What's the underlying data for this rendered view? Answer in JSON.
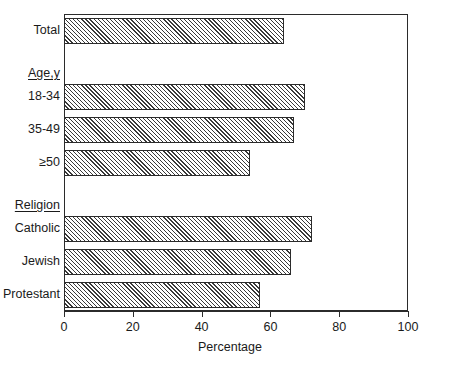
{
  "chart_data": {
    "type": "bar",
    "orientation": "horizontal",
    "title": "",
    "xlabel": "Percentage",
    "ylabel": "",
    "xlim": [
      0,
      100
    ],
    "xticks": [
      0,
      20,
      40,
      60,
      80,
      100
    ],
    "xticklabels": [
      "0",
      "20",
      "40",
      "60",
      "80",
      "100"
    ],
    "grid": false,
    "legend": null,
    "categories": [
      "Total",
      "18-34",
      "35-49",
      "≥50",
      "Catholic",
      "Jewish",
      "Protestant"
    ],
    "values": [
      64,
      70,
      67,
      54,
      72,
      66,
      57
    ],
    "group_headers": [
      "Age,y",
      "Religion"
    ],
    "rows": [
      {
        "kind": "bar",
        "label": "Total",
        "value": 64
      },
      {
        "kind": "header",
        "label": "Age,y",
        "value": null
      },
      {
        "kind": "bar",
        "label": "18-34",
        "value": 70
      },
      {
        "kind": "bar",
        "label": "35-49",
        "value": 67
      },
      {
        "kind": "bar",
        "label": "≥50",
        "value": 54
      },
      {
        "kind": "header",
        "label": "Religion",
        "value": null
      },
      {
        "kind": "bar",
        "label": "Catholic",
        "value": 72
      },
      {
        "kind": "bar",
        "label": "Jewish",
        "value": 66
      },
      {
        "kind": "bar",
        "label": "Protestant",
        "value": 57
      }
    ],
    "colors": {
      "bar_fill": "#ffffff",
      "bar_hatch": "#3a3a3a",
      "bar_edge": "#2b2b2b",
      "axis": "#2b2b2b",
      "text": "#1a1a1a",
      "background": "#ffffff"
    }
  }
}
